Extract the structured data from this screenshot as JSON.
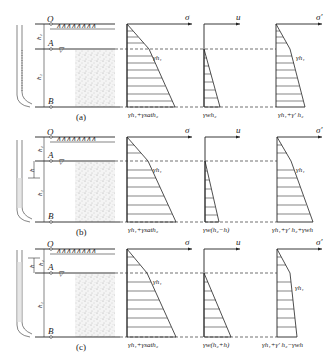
{
  "figure": {
    "panels": [
      {
        "id": "a",
        "caption": "(a)",
        "points": {
          "O": "O",
          "A": "A",
          "B": "B"
        },
        "depths": {
          "upper": "h₁",
          "lower": "h₂"
        },
        "standpipe": "water level at ground surface",
        "sigma": {
          "axis": "σ",
          "mid": "γh₁",
          "bottom": "γh₁+γsath₂"
        },
        "u": {
          "axis": "u",
          "bottom": "γwh₂"
        },
        "sigma_eff": {
          "axis": "σ′",
          "mid": "γh₁",
          "bottom": "γh₁+γ′h₂"
        }
      },
      {
        "id": "b",
        "caption": "(b)",
        "points": {
          "O": "O",
          "A": "A",
          "B": "B"
        },
        "depths": {
          "upper": "h₁",
          "lower": "h₂",
          "head": "h"
        },
        "standpipe": "water level below A by h",
        "sigma": {
          "axis": "σ",
          "mid": "γh₁",
          "bottom": "γh₁+γsath₂"
        },
        "u": {
          "axis": "u",
          "bottom": "γw(h₂−h)"
        },
        "sigma_eff": {
          "axis": "σ′",
          "mid": "γh₁",
          "bottom": "γh₁+γ′h₂+γwh"
        }
      },
      {
        "id": "c",
        "caption": "(c)",
        "points": {
          "O": "O",
          "A": "A",
          "B": "B"
        },
        "depths": {
          "upper": "h₁",
          "lower": "h₂",
          "head": "h"
        },
        "standpipe": "water level above A by h",
        "sigma": {
          "axis": "σ",
          "mid": "γh₁",
          "bottom": "γh₁+γsath₂"
        },
        "u": {
          "axis": "u",
          "bottom": "γw(h₂+h)"
        },
        "sigma_eff": {
          "axis": "σ′",
          "mid": "γh₁",
          "bottom": "γh₁+γ′h₂−γwh"
        }
      }
    ],
    "labels": {
      "O": "O",
      "A": "A",
      "B": "B",
      "h1": "h",
      "h1sub": "1",
      "h2": "h",
      "h2sub": "2",
      "h": "h",
      "sigma": "σ",
      "u": "u",
      "sigma_eff": "σ′",
      "gh1": "γh₁",
      "cap_a": "(a)",
      "cap_b": "(b)",
      "cap_c": "(c)",
      "a_sig_bot": "γh₁+γsath₂",
      "a_u_bot": "γwh₂",
      "a_se_bot": "γh₁+γ′ h₂",
      "b_sig_bot": "γh₁+γsath₂",
      "b_u_bot": "γw(h₂−h)",
      "b_se_bot": "γh₁+γ′ h₂+γwh",
      "c_sig_bot": "γh₁+γsath₂",
      "c_u_bot": "γw(h₂+h)",
      "c_se_bot": "γh₁+γ′ h₂−γwh"
    }
  }
}
